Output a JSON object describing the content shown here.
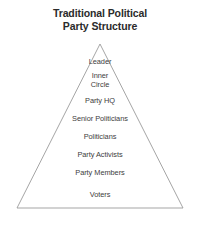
{
  "title": {
    "line1": "Traditional Political",
    "line2": "Party Structure"
  },
  "colors": {
    "background": "#ffffff",
    "title_text": "#2b2b2b",
    "label_text": "#3d3d3d",
    "outline": "#9b9b9b",
    "divider": "#c9c9c9"
  },
  "chart_data": {
    "type": "pyramid",
    "title": "Traditional Political Party Structure",
    "orientation": "apex-top",
    "tier_count": 9,
    "tiers": [
      {
        "rank": 1,
        "label": "Leader",
        "label_line2": ""
      },
      {
        "rank": 2,
        "label": "Inner",
        "label_line2": "Circle"
      },
      {
        "rank": 3,
        "label": "Party HQ",
        "label_line2": ""
      },
      {
        "rank": 4,
        "label": "Senior Politicians",
        "label_line2": ""
      },
      {
        "rank": 5,
        "label": "Politicians",
        "label_line2": ""
      },
      {
        "rank": 6,
        "label": "Party Activists",
        "label_line2": ""
      },
      {
        "rank": 7,
        "label": "Party Members",
        "label_line2": ""
      },
      {
        "rank": 8,
        "label": "Voters",
        "label_line2": ""
      }
    ]
  },
  "pyramid": {
    "apex_x": 100,
    "apex_y": 44,
    "base_y": 208,
    "base_left_x": 17,
    "base_right_x": 183,
    "divider_y": [
      69,
      92,
      110,
      128,
      146,
      164,
      183
    ],
    "tiers": [
      {
        "name": "leader",
        "label": "Leader",
        "label_line2": "",
        "center_y": 62,
        "lines": 1
      },
      {
        "name": "inner-circle",
        "label": "Inner",
        "label_line2": "Circle",
        "center_y": 80.5,
        "lines": 2
      },
      {
        "name": "party-hq",
        "label": "Party HQ",
        "label_line2": "",
        "center_y": 101,
        "lines": 1
      },
      {
        "name": "senior-politicians",
        "label": "Senior Politicians",
        "label_line2": "",
        "center_y": 119,
        "lines": 1
      },
      {
        "name": "politicians",
        "label": "Politicians",
        "label_line2": "",
        "center_y": 137,
        "lines": 1
      },
      {
        "name": "party-activists",
        "label": "Party Activists",
        "label_line2": "",
        "center_y": 155,
        "lines": 1
      },
      {
        "name": "party-members",
        "label": "Party Members",
        "label_line2": "",
        "center_y": 173.5,
        "lines": 1
      },
      {
        "name": "voters",
        "label": "Voters",
        "label_line2": "",
        "center_y": 195.5,
        "lines": 1
      }
    ]
  }
}
